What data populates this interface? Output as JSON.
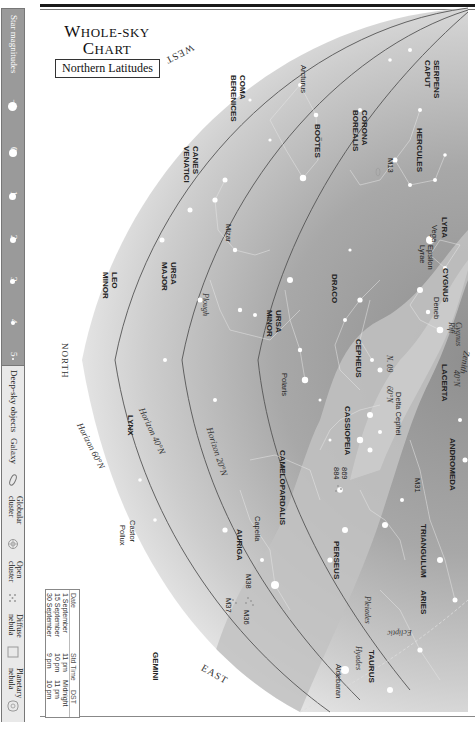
{
  "title": {
    "line1_cap": "W",
    "line1_rest": "HOLE-SKY",
    "line2_cap": "C",
    "line2_rest": "HART",
    "subtitle": "Northern Latitudes"
  },
  "legend": {
    "star_magnitudes_label": "Star magnitudes",
    "magnitudes": [
      {
        "label": "−1",
        "size": 9
      },
      {
        "label": "0",
        "size": 8
      },
      {
        "label": "1",
        "size": 7
      },
      {
        "label": "2",
        "size": 6
      },
      {
        "label": "3",
        "size": 5
      },
      {
        "label": "4",
        "size": 4
      },
      {
        "label": "5",
        "size": 2
      }
    ],
    "deep_sky_label": "Deep-sky objects",
    "deep_sky": [
      {
        "label": "Galaxy",
        "icon": "galaxy-ellipse-icon"
      },
      {
        "label": "Globular cluster",
        "icon": "globular-cluster-icon"
      },
      {
        "label": "Open cluster",
        "icon": "open-cluster-icon"
      },
      {
        "label": "Diffuse nebula",
        "icon": "diffuse-nebula-icon"
      },
      {
        "label": "Planetary nebula",
        "icon": "planetary-nebula-icon"
      }
    ]
  },
  "directions": {
    "west": "WEST",
    "east": "EAST",
    "north": "NORTH"
  },
  "horizons": {
    "h20": "Horizon 20°N",
    "h40": "Horizon 40°N",
    "h60": "Horizon 60°N",
    "zenith_label": "Zenith",
    "zenith_40": "40°N",
    "zenith_60": "60°N",
    "n20": "N. 09"
  },
  "ecliptic": "Ecliptic",
  "constellations": [
    "SERPENS CAPUT",
    "CORONA BOREALIS",
    "HERCULES",
    "LYRA",
    "BOÖTES",
    "COMA BERENICES",
    "CANES VENATICI",
    "URSA MAJOR",
    "LEO MINOR",
    "DRACO",
    "CYGNUS",
    "LACERTA",
    "CEPHEUS",
    "URSA MINOR",
    "CASSIOPEIA",
    "ANDROMEDA",
    "CAMELOPARDALIS",
    "LYNX",
    "PERSEUS",
    "TRIANGULUM",
    "ARIES",
    "AURIGA",
    "TAURUS",
    "GEMINI"
  ],
  "stars_and_objects": {
    "arcturus": "Arcturus",
    "vega": "Vega",
    "epsilon_lyrae": "Epsilon Lyrae",
    "deneb": "Deneb",
    "cygnus_rift": "Cygnus Rift",
    "mizar": "Mizar",
    "plough": "Plough",
    "polaris": "Polaris",
    "delta_cephei": "Delta Cephei",
    "m13": "M13",
    "m31": "M31",
    "h869": "869",
    "h884": "884",
    "capella": "Capella",
    "m36": "M36",
    "m37": "M37",
    "m38": "M38",
    "castor": "Castor",
    "pollux": "Pollux",
    "pleiades": "Pleiades",
    "hyades": "Hyades",
    "aldebaran": "Aldebaran"
  },
  "time_table": {
    "headers": [
      "Date",
      "Std Time",
      "DST"
    ],
    "rows": [
      [
        "1 September",
        "11 pm",
        "Midnight"
      ],
      [
        "15 September",
        "10 pm",
        "11 pm"
      ],
      [
        "30 September",
        "9 pm",
        "10 pm"
      ]
    ]
  },
  "colors": {
    "sky_outer": "#efefef",
    "sky_mid": "#c9c9c9",
    "sky_inner": "#a5a5a5",
    "milky_way": "#bdbdbd",
    "legend_mag_bg": "#9a9a9a"
  }
}
